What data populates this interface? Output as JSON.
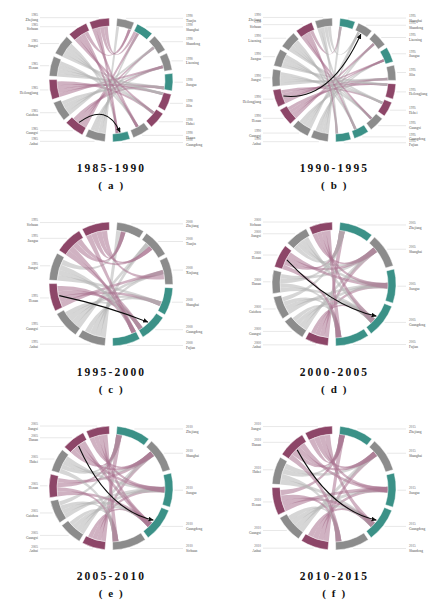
{
  "figure": {
    "type": "chord-diagram-grid",
    "background": "#ffffff",
    "rows": 3,
    "cols": 2
  },
  "palette": {
    "teal": "#3b9187",
    "purple": "#8d4668",
    "gray": "#8c8c8c",
    "chord_teal": "#6bb3aa",
    "chord_purple": "#a97390",
    "chord_gray": "#b4b4b4",
    "arrow": "#0d0d0d",
    "leader": "#b9b9b9",
    "label": "#4a4a4a"
  },
  "chart_data": {
    "type": "chord",
    "panels": [
      {
        "id": "a",
        "letter": "( a )",
        "title": "1985-1990",
        "origin_year": "1985",
        "dest_year": "1990",
        "left_labels": [
          {
            "year": "1985",
            "name": "Anhui",
            "color": "gray"
          },
          {
            "year": "1985",
            "name": "Guangxi",
            "color": "purple"
          },
          {
            "year": "1985",
            "name": "Guizhou",
            "color": "gray"
          },
          {
            "year": "1985",
            "name": "Heilongjiang",
            "color": "purple"
          },
          {
            "year": "1985",
            "name": "Henan",
            "color": "gray"
          },
          {
            "year": "1985",
            "name": "Jiangxi",
            "color": "gray"
          },
          {
            "year": "1985",
            "name": "Sichuan",
            "color": "purple"
          },
          {
            "year": "1985",
            "name": "Zhejiang",
            "color": "purple"
          }
        ],
        "right_labels": [
          {
            "year": "1990",
            "name": "Tianjin",
            "color": "gray"
          },
          {
            "year": "1990",
            "name": "Shanghai",
            "color": "teal"
          },
          {
            "year": "1990",
            "name": "Shandong",
            "color": "gray"
          },
          {
            "year": "1990",
            "name": "Liaoning",
            "color": "gray"
          },
          {
            "year": "1990",
            "name": "Jiangsu",
            "color": "teal"
          },
          {
            "year": "1990",
            "name": "Jilin",
            "color": "purple"
          },
          {
            "year": "1990",
            "name": "Hubei",
            "color": "purple"
          },
          {
            "year": "1990",
            "name": "Henan",
            "color": "gray"
          },
          {
            "year": "1990",
            "name": "Guangdong",
            "color": "teal"
          }
        ],
        "arrow": {
          "from": "Guangxi",
          "to": "Guangdong"
        }
      },
      {
        "id": "b",
        "letter": "( b )",
        "title": "1990-1995",
        "origin_year": "1990",
        "dest_year": "1995",
        "left_labels": [
          {
            "year": "1990",
            "name": "Anhui",
            "color": "gray"
          },
          {
            "year": "1990",
            "name": "Guangxi",
            "color": "gray"
          },
          {
            "year": "1990",
            "name": "Henan",
            "color": "purple"
          },
          {
            "year": "1990",
            "name": "Heilongjiang",
            "color": "purple"
          },
          {
            "year": "1990",
            "name": "Jiangxi",
            "color": "gray"
          },
          {
            "year": "1990",
            "name": "Jiangsu",
            "color": "gray"
          },
          {
            "year": "1990",
            "name": "Liaoning",
            "color": "gray"
          },
          {
            "year": "1990",
            "name": "Sichuan",
            "color": "purple"
          },
          {
            "year": "1990",
            "name": "Zhejiang",
            "color": "gray"
          }
        ],
        "right_labels": [
          {
            "year": "1995",
            "name": "Shanghai",
            "color": "teal"
          },
          {
            "year": "1995",
            "name": "Shandong",
            "color": "gray"
          },
          {
            "year": "1995",
            "name": "Liaoning",
            "color": "gray"
          },
          {
            "year": "1995",
            "name": "Jiangsu",
            "color": "teal"
          },
          {
            "year": "1995",
            "name": "Jilin",
            "color": "gray"
          },
          {
            "year": "1995",
            "name": "Heilongjiang",
            "color": "purple"
          },
          {
            "year": "1995",
            "name": "Hebei",
            "color": "purple"
          },
          {
            "year": "1995",
            "name": "Guangxi",
            "color": "gray"
          },
          {
            "year": "1995",
            "name": "Guangdong",
            "color": "teal"
          },
          {
            "year": "1995",
            "name": "Fujian",
            "color": "teal"
          }
        ],
        "arrow": {
          "from": "Heilongjiang",
          "to": "Shandong"
        }
      },
      {
        "id": "c",
        "letter": "( c )",
        "title": "1995-2000",
        "origin_year": "1995",
        "dest_year": "2000",
        "left_labels": [
          {
            "year": "1995",
            "name": "Anhui",
            "color": "gray"
          },
          {
            "year": "1995",
            "name": "Guangxi",
            "color": "gray"
          },
          {
            "year": "1995",
            "name": "Henan",
            "color": "purple"
          },
          {
            "year": "1995",
            "name": "Jiangxi",
            "color": "gray"
          },
          {
            "year": "1995",
            "name": "Jiangsu",
            "color": "purple"
          },
          {
            "year": "1995",
            "name": "Sichuan",
            "color": "purple"
          }
        ],
        "right_labels": [
          {
            "year": "2000",
            "name": "Zhejiang",
            "color": "gray"
          },
          {
            "year": "2000",
            "name": "Tianjin",
            "color": "gray"
          },
          {
            "year": "2000",
            "name": "Xinjiang",
            "color": "gray"
          },
          {
            "year": "2000",
            "name": "Shanghai",
            "color": "teal"
          },
          {
            "year": "2000",
            "name": "Guangdong",
            "color": "teal"
          },
          {
            "year": "2000",
            "name": "Fujian",
            "color": "teal"
          }
        ],
        "arrow": {
          "from": "Henan",
          "to": "Guangdong"
        }
      },
      {
        "id": "d",
        "letter": "( d )",
        "title": "2000-2005",
        "origin_year": "2000",
        "dest_year": "2005",
        "left_labels": [
          {
            "year": "2000",
            "name": "Anhui",
            "color": "purple"
          },
          {
            "year": "2000",
            "name": "Guangxi",
            "color": "gray"
          },
          {
            "year": "2000",
            "name": "Guizhou",
            "color": "gray"
          },
          {
            "year": "2000",
            "name": "Hunan",
            "color": "gray"
          },
          {
            "year": "2000",
            "name": "Henan",
            "color": "purple"
          },
          {
            "year": "2000",
            "name": "Jiangxi",
            "color": "gray"
          },
          {
            "year": "2000",
            "name": "Sichuan",
            "color": "purple"
          }
        ],
        "right_labels": [
          {
            "year": "2005",
            "name": "Zhejiang",
            "color": "teal"
          },
          {
            "year": "2005",
            "name": "Shanghai",
            "color": "gray"
          },
          {
            "year": "2005",
            "name": "Jiangsu",
            "color": "teal"
          },
          {
            "year": "2005",
            "name": "Guangdong",
            "color": "teal"
          },
          {
            "year": "2005",
            "name": "Fujian",
            "color": "teal"
          }
        ],
        "arrow": {
          "from": "Henan",
          "to": "Guangdong"
        }
      },
      {
        "id": "e",
        "letter": "( e )",
        "title": "2005-2010",
        "origin_year": "2005",
        "dest_year": "2010",
        "left_labels": [
          {
            "year": "2005",
            "name": "Anhui",
            "color": "purple"
          },
          {
            "year": "2005",
            "name": "Guangxi",
            "color": "gray"
          },
          {
            "year": "2005",
            "name": "Guizhou",
            "color": "gray"
          },
          {
            "year": "2005",
            "name": "Henan",
            "color": "purple"
          },
          {
            "year": "2005",
            "name": "Hubei",
            "color": "gray"
          },
          {
            "year": "2005",
            "name": "Hunan",
            "color": "purple"
          },
          {
            "year": "2005",
            "name": "Jiangxi",
            "color": "purple"
          }
        ],
        "right_labels": [
          {
            "year": "2010",
            "name": "Zhejiang",
            "color": "teal"
          },
          {
            "year": "2010",
            "name": "Shanghai",
            "color": "gray"
          },
          {
            "year": "2010",
            "name": "Jiangsu",
            "color": "teal"
          },
          {
            "year": "2010",
            "name": "Guangdong",
            "color": "teal"
          },
          {
            "year": "2010",
            "name": "Sichuan",
            "color": "gray"
          }
        ],
        "arrow": {
          "from": "Hunan",
          "to": "Guangdong"
        }
      },
      {
        "id": "f",
        "letter": "( f )",
        "title": "2010-2015",
        "origin_year": "2010",
        "dest_year": "2015",
        "left_labels": [
          {
            "year": "2010",
            "name": "Anhui",
            "color": "purple"
          },
          {
            "year": "2010",
            "name": "Guangxi",
            "color": "gray"
          },
          {
            "year": "2010",
            "name": "Henan",
            "color": "purple"
          },
          {
            "year": "2010",
            "name": "Hubei",
            "color": "gray"
          },
          {
            "year": "2010",
            "name": "Hunan",
            "color": "purple"
          },
          {
            "year": "2010",
            "name": "Jiangxi",
            "color": "purple"
          }
        ],
        "right_labels": [
          {
            "year": "2015",
            "name": "Zhejiang",
            "color": "teal"
          },
          {
            "year": "2015",
            "name": "Shanghai",
            "color": "gray"
          },
          {
            "year": "2015",
            "name": "Jiangsu",
            "color": "teal"
          },
          {
            "year": "2015",
            "name": "Guangdong",
            "color": "teal"
          },
          {
            "year": "2015",
            "name": "Shandong",
            "color": "gray"
          }
        ],
        "arrow": {
          "from": "Hunan",
          "to": "Guangdong"
        }
      }
    ]
  }
}
